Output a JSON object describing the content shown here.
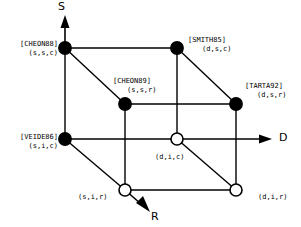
{
  "figure": {
    "type": "diagram",
    "subtype": "3d-cube-taxonomy",
    "background": "#ffffff",
    "stroke_color": "#000000",
    "node_fill_solid": "#000000",
    "node_fill_open": "#ffffff"
  },
  "axes": [
    {
      "id": "S",
      "label": "S",
      "direction": "up"
    },
    {
      "id": "D",
      "label": "D",
      "direction": "right"
    },
    {
      "id": "R",
      "label": "R",
      "direction": "down-right"
    }
  ],
  "nodes": [
    {
      "id": "cheon88",
      "ref": "[CHEON88]",
      "coord": "(s,s,c)",
      "filled": true,
      "x": 65,
      "y": 48
    },
    {
      "id": "smith85",
      "ref": "[SMITH85]",
      "coord": "(d,s,c)",
      "filled": true,
      "x": 177,
      "y": 48
    },
    {
      "id": "cheon89",
      "ref": "[CHEON89]",
      "coord": "(s,s,r)",
      "filled": true,
      "x": 125,
      "y": 104
    },
    {
      "id": "tarta92",
      "ref": "[TARTA92]",
      "coord": "(d,s,r)",
      "filled": true,
      "x": 236,
      "y": 104
    },
    {
      "id": "veide86",
      "ref": "[VEIDE86]",
      "coord": "(s,i,c)",
      "filled": true,
      "x": 65,
      "y": 139
    },
    {
      "id": "dic",
      "ref": "",
      "coord": "(d,i,c)",
      "filled": false,
      "x": 177,
      "y": 139
    },
    {
      "id": "sir",
      "ref": "",
      "coord": "(s,i,r)",
      "filled": false,
      "x": 125,
      "y": 190
    },
    {
      "id": "dir",
      "ref": "",
      "coord": "(d,i,r)",
      "filled": false,
      "x": 236,
      "y": 190
    }
  ],
  "labels": {
    "cheon88": {
      "ref": "[CHEON88]",
      "coord": "(s,s,c)"
    },
    "smith85": {
      "ref": "[SMITH85]",
      "coord": "(d,s,c)"
    },
    "cheon89": {
      "ref": "[CHEON89]",
      "coord": "(s,s,r)"
    },
    "tarta92": {
      "ref": "[TARTA92]",
      "coord": "(d,s,r)"
    },
    "veide86": {
      "ref": "[VEIDE86]",
      "coord": "(s,i,c)"
    },
    "dic": {
      "coord": "(d,i,c)"
    },
    "sir": {
      "coord": "(s,i,r)"
    },
    "dir": {
      "coord": "(d,i,r)"
    }
  },
  "axis_labels": {
    "s": "S",
    "d": "D",
    "r": "R"
  }
}
